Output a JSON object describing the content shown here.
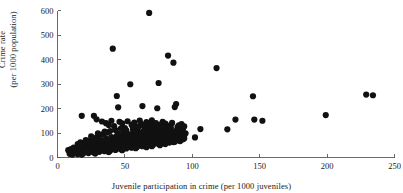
{
  "chart_data": {
    "type": "scatter",
    "title": "",
    "xlabel": "Juvenile participation in crime (per 1000 juveniles)",
    "ylabel_line1": "Crime rate",
    "ylabel_line2": "(per 1000 population)",
    "xlim": [
      0,
      250
    ],
    "ylim": [
      0,
      600
    ],
    "xticks": [
      0,
      50,
      100,
      150,
      200,
      250
    ],
    "yticks": [
      0,
      100,
      200,
      300,
      400,
      500,
      600
    ],
    "grid": false,
    "legend": false,
    "marker_color": "#111111",
    "marker_size": 3.1,
    "axis_color": "#5a5a5a",
    "background": "#ffffff",
    "points": [
      [
        68,
        590
      ],
      [
        41,
        444
      ],
      [
        82,
        416
      ],
      [
        86,
        387
      ],
      [
        118,
        365
      ],
      [
        54,
        299
      ],
      [
        75,
        304
      ],
      [
        44,
        251
      ],
      [
        145,
        250
      ],
      [
        229,
        257
      ],
      [
        234,
        254
      ],
      [
        63,
        210
      ],
      [
        45,
        205
      ],
      [
        88,
        218
      ],
      [
        87,
        206
      ],
      [
        74,
        201
      ],
      [
        199,
        173
      ],
      [
        18,
        170
      ],
      [
        27,
        170
      ],
      [
        29,
        156
      ],
      [
        132,
        155
      ],
      [
        146,
        155
      ],
      [
        152,
        150
      ],
      [
        106,
        116
      ],
      [
        126,
        115
      ],
      [
        102,
        82
      ],
      [
        33,
        147
      ],
      [
        36,
        140
      ],
      [
        38,
        133
      ],
      [
        40,
        150
      ],
      [
        42,
        128
      ],
      [
        46,
        146
      ],
      [
        48,
        139
      ],
      [
        50,
        120
      ],
      [
        52,
        148
      ],
      [
        55,
        133
      ],
      [
        57,
        142
      ],
      [
        59,
        126
      ],
      [
        61,
        151
      ],
      [
        62,
        137
      ],
      [
        64,
        129
      ],
      [
        66,
        144
      ],
      [
        67,
        120
      ],
      [
        69,
        135
      ],
      [
        70,
        152
      ],
      [
        71,
        131
      ],
      [
        72,
        125
      ],
      [
        73,
        140
      ],
      [
        76,
        133
      ],
      [
        77,
        118
      ],
      [
        78,
        145
      ],
      [
        79,
        126
      ],
      [
        80,
        138
      ],
      [
        81,
        122
      ],
      [
        83,
        130
      ],
      [
        84,
        116
      ],
      [
        85,
        141
      ],
      [
        89,
        124
      ],
      [
        90,
        131
      ],
      [
        91,
        118
      ],
      [
        92,
        136
      ],
      [
        93,
        112
      ],
      [
        94,
        127
      ],
      [
        95,
        99
      ],
      [
        8,
        30
      ],
      [
        9,
        25
      ],
      [
        10,
        34
      ],
      [
        11,
        28
      ],
      [
        12,
        40
      ],
      [
        13,
        22
      ],
      [
        14,
        36
      ],
      [
        15,
        45
      ],
      [
        16,
        31
      ],
      [
        17,
        27
      ],
      [
        18,
        52
      ],
      [
        19,
        38
      ],
      [
        20,
        44
      ],
      [
        21,
        30
      ],
      [
        22,
        57
      ],
      [
        23,
        41
      ],
      [
        24,
        35
      ],
      [
        25,
        62
      ],
      [
        26,
        48
      ],
      [
        27,
        29
      ],
      [
        28,
        55
      ],
      [
        29,
        66
      ],
      [
        30,
        43
      ],
      [
        31,
        51
      ],
      [
        32,
        72
      ],
      [
        33,
        38
      ],
      [
        34,
        60
      ],
      [
        35,
        47
      ],
      [
        36,
        78
      ],
      [
        37,
        55
      ],
      [
        38,
        64
      ],
      [
        39,
        42
      ],
      [
        40,
        83
      ],
      [
        41,
        58
      ],
      [
        42,
        70
      ],
      [
        43,
        49
      ],
      [
        44,
        88
      ],
      [
        45,
        63
      ],
      [
        46,
        75
      ],
      [
        47,
        54
      ],
      [
        48,
        93
      ],
      [
        49,
        68
      ],
      [
        50,
        80
      ],
      [
        51,
        59
      ],
      [
        52,
        97
      ],
      [
        53,
        72
      ],
      [
        54,
        85
      ],
      [
        55,
        64
      ],
      [
        56,
        101
      ],
      [
        57,
        77
      ],
      [
        58,
        90
      ],
      [
        59,
        69
      ],
      [
        60,
        105
      ],
      [
        61,
        81
      ],
      [
        62,
        94
      ],
      [
        63,
        73
      ],
      [
        64,
        109
      ],
      [
        65,
        85
      ],
      [
        66,
        98
      ],
      [
        67,
        77
      ],
      [
        68,
        112
      ],
      [
        69,
        88
      ],
      [
        70,
        101
      ],
      [
        71,
        80
      ],
      [
        72,
        115
      ],
      [
        73,
        91
      ],
      [
        74,
        104
      ],
      [
        75,
        83
      ],
      [
        76,
        118
      ],
      [
        77,
        94
      ],
      [
        78,
        107
      ],
      [
        79,
        86
      ],
      [
        80,
        120
      ],
      [
        81,
        96
      ],
      [
        82,
        109
      ],
      [
        83,
        88
      ],
      [
        84,
        100
      ],
      [
        85,
        91
      ],
      [
        86,
        104
      ],
      [
        87,
        85
      ],
      [
        88,
        96
      ],
      [
        89,
        88
      ],
      [
        90,
        92
      ],
      [
        91,
        86
      ],
      [
        92,
        95
      ],
      [
        93,
        84
      ],
      [
        94,
        90
      ],
      [
        10,
        20
      ],
      [
        12,
        18
      ],
      [
        14,
        24
      ],
      [
        16,
        21
      ],
      [
        18,
        26
      ],
      [
        20,
        23
      ],
      [
        22,
        33
      ],
      [
        24,
        28
      ],
      [
        26,
        37
      ],
      [
        28,
        25
      ],
      [
        30,
        35
      ],
      [
        32,
        30
      ],
      [
        34,
        44
      ],
      [
        36,
        33
      ],
      [
        38,
        48
      ],
      [
        40,
        36
      ],
      [
        42,
        53
      ],
      [
        44,
        41
      ],
      [
        46,
        57
      ],
      [
        48,
        45
      ],
      [
        50,
        61
      ],
      [
        52,
        50
      ],
      [
        54,
        66
      ],
      [
        56,
        53
      ],
      [
        58,
        70
      ],
      [
        60,
        58
      ],
      [
        62,
        75
      ],
      [
        64,
        62
      ],
      [
        66,
        79
      ],
      [
        68,
        66
      ],
      [
        70,
        83
      ],
      [
        72,
        70
      ],
      [
        74,
        87
      ],
      [
        76,
        73
      ],
      [
        78,
        91
      ],
      [
        80,
        76
      ],
      [
        82,
        94
      ],
      [
        84,
        79
      ],
      [
        86,
        82
      ],
      [
        88,
        77
      ],
      [
        90,
        85
      ],
      [
        9,
        15
      ],
      [
        11,
        12
      ],
      [
        13,
        17
      ],
      [
        15,
        14
      ],
      [
        17,
        19
      ],
      [
        19,
        16
      ],
      [
        21,
        22
      ],
      [
        23,
        18
      ],
      [
        25,
        24
      ],
      [
        27,
        20
      ],
      [
        29,
        27
      ],
      [
        31,
        23
      ],
      [
        33,
        29
      ],
      [
        35,
        26
      ],
      [
        37,
        32
      ],
      [
        39,
        28
      ],
      [
        41,
        35
      ],
      [
        43,
        31
      ],
      [
        45,
        38
      ],
      [
        47,
        34
      ],
      [
        49,
        41
      ],
      [
        51,
        37
      ],
      [
        53,
        44
      ],
      [
        55,
        40
      ],
      [
        57,
        47
      ],
      [
        59,
        43
      ],
      [
        61,
        50
      ],
      [
        63,
        46
      ],
      [
        65,
        53
      ],
      [
        67,
        49
      ],
      [
        69,
        56
      ],
      [
        71,
        52
      ],
      [
        73,
        59
      ],
      [
        75,
        55
      ],
      [
        77,
        62
      ],
      [
        79,
        58
      ],
      [
        81,
        65
      ],
      [
        83,
        61
      ],
      [
        85,
        68
      ],
      [
        87,
        64
      ],
      [
        89,
        71
      ],
      [
        91,
        67
      ],
      [
        93,
        74
      ],
      [
        20,
        60
      ],
      [
        23,
        68
      ],
      [
        26,
        75
      ],
      [
        29,
        82
      ],
      [
        31,
        90
      ],
      [
        34,
        95
      ],
      [
        37,
        102
      ],
      [
        39,
        108
      ],
      [
        43,
        112
      ],
      [
        47,
        118
      ],
      [
        49,
        104
      ],
      [
        51,
        111
      ],
      [
        56,
        115
      ],
      [
        58,
        108
      ],
      [
        65,
        117
      ],
      [
        67,
        110
      ],
      [
        71,
        119
      ],
      [
        75,
        113
      ],
      [
        79,
        121
      ],
      [
        15,
        55
      ],
      [
        17,
        62
      ],
      [
        19,
        49
      ],
      [
        21,
        71
      ],
      [
        25,
        86
      ],
      [
        30,
        99
      ],
      [
        35,
        106
      ],
      [
        45,
        97
      ],
      [
        60,
        124
      ],
      [
        64,
        132
      ],
      [
        78,
        128
      ],
      [
        84,
        123
      ],
      [
        88,
        109
      ],
      [
        92,
        103
      ],
      [
        70,
        46
      ],
      [
        58,
        38
      ],
      [
        48,
        30
      ],
      [
        38,
        22
      ],
      [
        28,
        16
      ],
      [
        18,
        12
      ],
      [
        76,
        50
      ],
      [
        86,
        63
      ],
      [
        90,
        70
      ],
      [
        94,
        78
      ],
      [
        80,
        55
      ],
      [
        66,
        42
      ]
    ]
  }
}
